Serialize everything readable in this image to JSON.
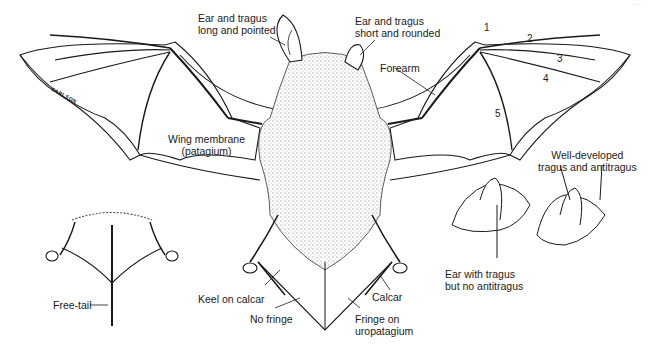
{
  "figure": {
    "corner_mark": "· · ·",
    "artist_signature": "CARLSON"
  },
  "labels": {
    "ear_long": {
      "line1": "Ear and tragus",
      "line2": "long and pointed"
    },
    "ear_short": {
      "line1": "Ear and tragus",
      "line2": "short and rounded"
    },
    "forearm": "Forearm",
    "wing_membrane": {
      "line1": "Wing membrane",
      "line2": "(patagium)"
    },
    "free_tail": "Free-tail",
    "keel_on_calcar": "Keel on calcar",
    "no_fringe": "No fringe",
    "calcar": "Calcar",
    "fringe": {
      "line1": "Fringe on",
      "line2": "uropatagium"
    },
    "ear_with_tragus": {
      "line1": "Ear with tragus",
      "line2": "but no antitragus"
    },
    "well_developed": {
      "line1": "Well-developed",
      "line2": "tragus and antitragus"
    }
  },
  "digits": [
    "1",
    "2",
    "3",
    "4",
    "5"
  ],
  "colors": {
    "ink": "#1a1a1a",
    "background": "#ffffff",
    "fur": "#555555"
  }
}
